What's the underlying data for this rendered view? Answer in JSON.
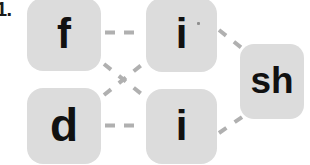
{
  "page": {
    "item_number": "1.",
    "background_color": "#ffffff"
  },
  "diagram": {
    "type": "grapheme-phoneme-matching",
    "node_fill_color": "#dcdcdc",
    "node_text_color": "#111111",
    "connector_color": "#b0b0b0",
    "connector_style": "dashed",
    "nodes": [
      {
        "id": "f",
        "label": "f",
        "column": "left",
        "row": "top"
      },
      {
        "id": "d",
        "label": "d",
        "column": "left",
        "row": "bottom"
      },
      {
        "id": "i-top",
        "label": "i",
        "column": "middle",
        "row": "top"
      },
      {
        "id": "i-bottom",
        "label": "i",
        "column": "middle",
        "row": "bottom"
      },
      {
        "id": "sh",
        "label": "sh",
        "column": "right",
        "row": "middle"
      }
    ],
    "connections": [
      {
        "from": "f",
        "to": "i-top",
        "shape": "horizontal"
      },
      {
        "from": "d",
        "to": "i-bottom",
        "shape": "horizontal"
      },
      {
        "from": "f",
        "to": "i-bottom",
        "shape": "diagonal-down"
      },
      {
        "from": "d",
        "to": "i-top",
        "shape": "diagonal-up"
      },
      {
        "from": "i-top",
        "to": "sh",
        "shape": "diagonal-down"
      },
      {
        "from": "i-bottom",
        "to": "sh",
        "shape": "diagonal-up"
      }
    ]
  }
}
